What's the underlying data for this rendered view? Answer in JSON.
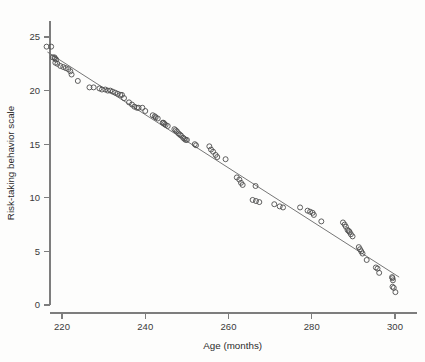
{
  "chart_data": {
    "type": "scatter",
    "title": "",
    "xlabel": "Age (months)",
    "ylabel": "Risk-taking behavior scale",
    "xlim": [
      215,
      302
    ],
    "ylim": [
      0,
      26.5
    ],
    "xticks": [
      220,
      240,
      260,
      280,
      300
    ],
    "yticks": [
      0,
      5,
      10,
      15,
      20,
      25
    ],
    "grid": false,
    "legend": null,
    "point_marker": "open-circle",
    "point_color": "#4d4d4d",
    "line_color": "#666666",
    "trendline": {
      "name": "linear fit",
      "x": [
        216.5,
        301.0
      ],
      "y": [
        23.6,
        2.6
      ]
    },
    "series": [
      {
        "name": "Risk-taking behavior",
        "points": [
          [
            216.3,
            24.1
          ],
          [
            217.4,
            24.1
          ],
          [
            217.8,
            23.1
          ],
          [
            218.2,
            23.1
          ],
          [
            218.3,
            23.0
          ],
          [
            218.4,
            22.6
          ],
          [
            218.6,
            22.9
          ],
          [
            218.9,
            22.5
          ],
          [
            219.6,
            22.3
          ],
          [
            220.3,
            22.2
          ],
          [
            220.9,
            22.1
          ],
          [
            221.5,
            22.0
          ],
          [
            222.0,
            21.8
          ],
          [
            222.3,
            21.5
          ],
          [
            223.8,
            20.9
          ],
          [
            226.6,
            20.3
          ],
          [
            227.6,
            20.3
          ],
          [
            229.0,
            20.2
          ],
          [
            229.6,
            20.1
          ],
          [
            230.4,
            20.1
          ],
          [
            231.0,
            20.0
          ],
          [
            231.6,
            20.0
          ],
          [
            232.2,
            19.9
          ],
          [
            232.8,
            19.8
          ],
          [
            233.4,
            19.7
          ],
          [
            234.0,
            19.6
          ],
          [
            234.4,
            19.6
          ],
          [
            234.9,
            19.3
          ],
          [
            236.1,
            18.9
          ],
          [
            236.8,
            18.7
          ],
          [
            237.4,
            18.5
          ],
          [
            238.0,
            18.4
          ],
          [
            238.4,
            18.4
          ],
          [
            239.3,
            18.4
          ],
          [
            240.0,
            18.1
          ],
          [
            241.8,
            17.7
          ],
          [
            242.3,
            17.6
          ],
          [
            242.5,
            17.5
          ],
          [
            243.0,
            17.4
          ],
          [
            244.2,
            17.0
          ],
          [
            244.4,
            17.0
          ],
          [
            244.6,
            16.9
          ],
          [
            244.9,
            16.8
          ],
          [
            245.4,
            16.7
          ],
          [
            247.0,
            16.4
          ],
          [
            247.3,
            16.3
          ],
          [
            247.6,
            16.2
          ],
          [
            248.0,
            16.0
          ],
          [
            248.3,
            15.9
          ],
          [
            248.6,
            15.8
          ],
          [
            249.1,
            15.6
          ],
          [
            249.4,
            15.5
          ],
          [
            249.7,
            15.4
          ],
          [
            250.0,
            15.4
          ],
          [
            251.9,
            15.0
          ],
          [
            252.2,
            14.9
          ],
          [
            255.4,
            14.8
          ],
          [
            255.8,
            14.5
          ],
          [
            256.3,
            14.3
          ],
          [
            256.9,
            14.0
          ],
          [
            257.3,
            13.8
          ],
          [
            259.3,
            13.6
          ],
          [
            262.0,
            11.9
          ],
          [
            262.6,
            11.7
          ],
          [
            263.0,
            11.4
          ],
          [
            263.4,
            11.2
          ],
          [
            266.5,
            11.1
          ],
          [
            265.8,
            9.8
          ],
          [
            266.6,
            9.7
          ],
          [
            267.4,
            9.6
          ],
          [
            271.0,
            9.4
          ],
          [
            272.3,
            9.2
          ],
          [
            273.1,
            9.1
          ],
          [
            277.2,
            9.1
          ],
          [
            279.0,
            8.8
          ],
          [
            279.6,
            8.7
          ],
          [
            280.2,
            8.6
          ],
          [
            280.5,
            8.4
          ],
          [
            282.3,
            7.8
          ],
          [
            287.5,
            7.7
          ],
          [
            287.9,
            7.5
          ],
          [
            288.2,
            7.3
          ],
          [
            288.6,
            7.0
          ],
          [
            288.9,
            6.9
          ],
          [
            289.1,
            6.8
          ],
          [
            289.4,
            6.6
          ],
          [
            289.8,
            6.4
          ],
          [
            291.3,
            5.4
          ],
          [
            291.6,
            5.2
          ],
          [
            291.9,
            5.0
          ],
          [
            292.2,
            4.8
          ],
          [
            293.2,
            4.2
          ],
          [
            295.4,
            3.5
          ],
          [
            295.8,
            3.4
          ],
          [
            296.2,
            3.0
          ],
          [
            299.3,
            2.6
          ],
          [
            299.4,
            2.5
          ],
          [
            299.5,
            2.3
          ],
          [
            299.4,
            1.7
          ],
          [
            299.7,
            1.6
          ],
          [
            300.1,
            1.2
          ]
        ]
      }
    ]
  },
  "axes": {
    "y_tick_labels": [
      "0",
      "5",
      "10",
      "15",
      "20",
      "25"
    ],
    "x_tick_labels": [
      "220",
      "240",
      "260",
      "280",
      "300"
    ]
  }
}
